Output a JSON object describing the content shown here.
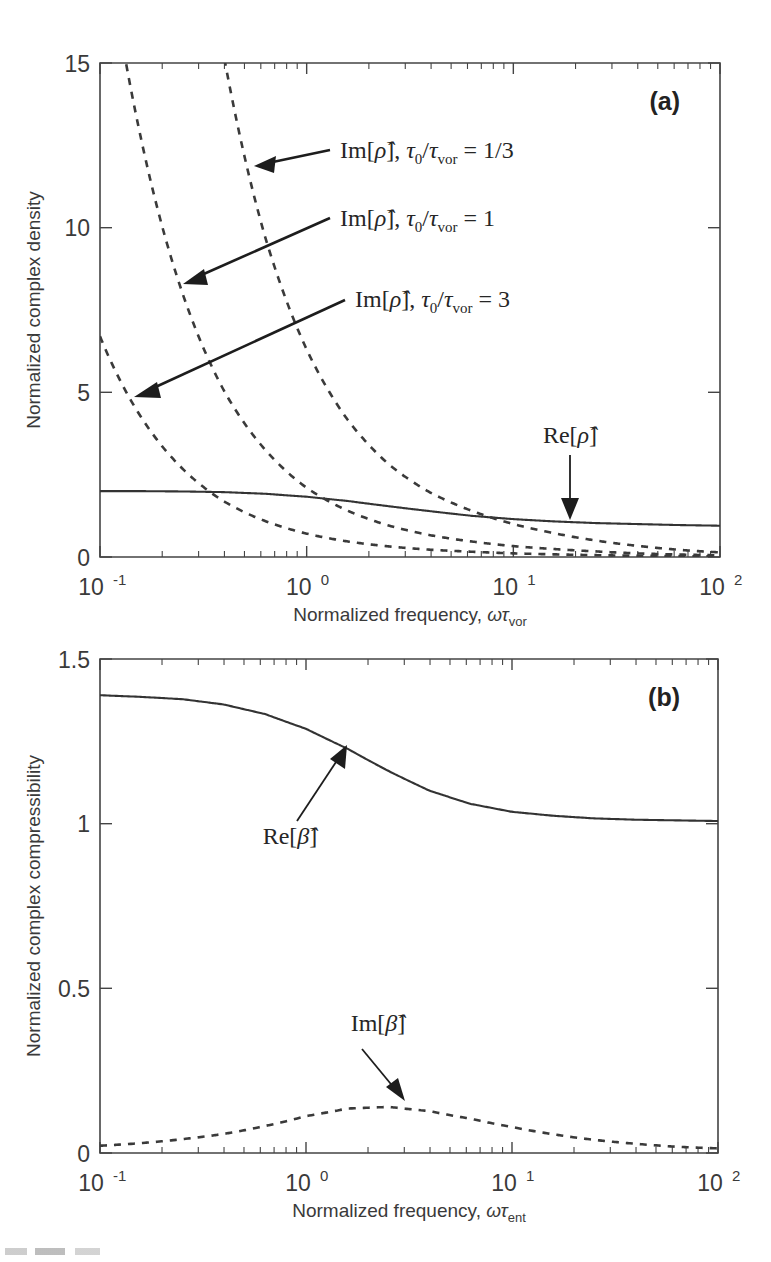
{
  "figure": {
    "panels": [
      {
        "tag": "(a)",
        "ylabel": "Normalized complex density",
        "xlabel_main": "Normalized frequency, ",
        "xlabel_sym": "ωτ",
        "xlabel_sub": "vor",
        "ytick_labels": [
          "0",
          "5",
          "10",
          "15"
        ],
        "xtick_labels": [
          "10",
          "10",
          "10",
          "10"
        ],
        "xtick_exps": [
          "-1",
          "0",
          "1",
          "2"
        ],
        "annotations": [
          {
            "name": "im-rho-third",
            "text_pre": "Im[",
            "sym": "ρ̂",
            "text_post": "], ",
            "tau": "τ",
            "tau_sub": "0",
            "slash": "/",
            "tau2": "τ",
            "tau2_sub": "vor",
            "eq": " = 1/3"
          },
          {
            "name": "im-rho-one",
            "text_pre": "Im[",
            "sym": "ρ̂",
            "text_post": "], ",
            "tau": "τ",
            "tau_sub": "0",
            "slash": "/",
            "tau2": "τ",
            "tau2_sub": "vor",
            "eq": " = 1"
          },
          {
            "name": "im-rho-three",
            "text_pre": "Im[",
            "sym": "ρ̂",
            "text_post": "], ",
            "tau": "τ",
            "tau_sub": "0",
            "slash": "/",
            "tau2": "τ",
            "tau2_sub": "vor",
            "eq": " = 3"
          },
          {
            "name": "re-rho",
            "text_pre": "Re[",
            "sym": "ρ̂",
            "text_post": "]",
            "tau": "",
            "tau_sub": "",
            "slash": "",
            "tau2": "",
            "tau2_sub": "",
            "eq": ""
          }
        ]
      },
      {
        "tag": "(b)",
        "ylabel": "Normalized complex compressibility",
        "xlabel_main": "Normalized frequency, ",
        "xlabel_sym": "ωτ",
        "xlabel_sub": "ent",
        "ytick_labels": [
          "0",
          "0.5",
          "1",
          "1.5"
        ],
        "xtick_labels": [
          "10",
          "10",
          "10",
          "10"
        ],
        "xtick_exps": [
          "-1",
          "0",
          "1",
          "2"
        ],
        "annotations": [
          {
            "name": "re-beta",
            "text_pre": "Re[",
            "sym": "β̂",
            "text_post": "]"
          },
          {
            "name": "im-beta",
            "text_pre": "Im[",
            "sym": "β̂",
            "text_post": "]"
          }
        ]
      }
    ]
  },
  "chart_data": [
    {
      "type": "line",
      "panel": "(a)",
      "title": "",
      "xlabel": "Normalized frequency, ωτ_vor",
      "ylabel": "Normalized complex density",
      "xscale": "log",
      "xlim": [
        0.1,
        100
      ],
      "ylim": [
        0,
        15
      ],
      "yticks": [
        0,
        5,
        10,
        15
      ],
      "xticks": [
        0.1,
        1,
        10,
        100
      ],
      "grid": false,
      "legend_position": "inline-annotations",
      "series": [
        {
          "name": "Re[ρ̂]",
          "style": "solid",
          "x": [
            0.1,
            0.158,
            0.251,
            0.398,
            0.631,
            1.0,
            1.585,
            2.512,
            3.981,
            6.31,
            10.0,
            15.85,
            25.12,
            39.81,
            63.1,
            100.0
          ],
          "y": [
            2.0,
            2.0,
            1.99,
            1.97,
            1.92,
            1.83,
            1.7,
            1.54,
            1.39,
            1.25,
            1.15,
            1.08,
            1.03,
            1.0,
            0.97,
            0.95
          ]
        },
        {
          "name": "Im[ρ̂], τ₀/τ_vor = 1/3",
          "style": "dashed",
          "x": [
            0.1,
            0.158,
            0.251,
            0.398,
            0.631,
            1.0,
            1.585,
            2.512,
            3.981,
            6.31,
            10.0,
            15.85,
            25.12,
            39.81,
            63.1,
            100.0
          ],
          "y": [
            60.0,
            38.0,
            24.0,
            15.2,
            9.7,
            6.3,
            4.15,
            2.8,
            1.95,
            1.4,
            1.0,
            0.72,
            0.5,
            0.34,
            0.22,
            0.14
          ]
        },
        {
          "name": "Im[ρ̂], τ₀/τ_vor = 1",
          "style": "dashed",
          "x": [
            0.1,
            0.158,
            0.251,
            0.398,
            0.631,
            1.0,
            1.585,
            2.512,
            3.981,
            6.31,
            10.0,
            15.85,
            25.12,
            39.81,
            63.1,
            100.0
          ],
          "y": [
            20.0,
            12.7,
            8.0,
            5.05,
            3.25,
            2.1,
            1.4,
            0.95,
            0.66,
            0.47,
            0.33,
            0.24,
            0.17,
            0.11,
            0.075,
            0.05
          ]
        },
        {
          "name": "Im[ρ̂], τ₀/τ_vor = 3",
          "style": "dashed",
          "x": [
            0.1,
            0.158,
            0.251,
            0.398,
            0.631,
            1.0,
            1.585,
            2.512,
            3.981,
            6.31,
            10.0,
            15.85,
            25.12,
            39.81,
            63.1,
            100.0
          ],
          "y": [
            6.7,
            4.25,
            2.68,
            1.69,
            1.09,
            0.71,
            0.47,
            0.32,
            0.22,
            0.16,
            0.11,
            0.08,
            0.056,
            0.038,
            0.025,
            0.017
          ]
        }
      ]
    },
    {
      "type": "line",
      "panel": "(b)",
      "title": "",
      "xlabel": "Normalized frequency, ωτ_ent",
      "ylabel": "Normalized complex compressibility",
      "xscale": "log",
      "xlim": [
        0.1,
        100
      ],
      "ylim": [
        0,
        1.5
      ],
      "yticks": [
        0,
        0.5,
        1,
        1.5
      ],
      "xticks": [
        0.1,
        1,
        10,
        100
      ],
      "grid": false,
      "legend_position": "inline-annotations",
      "series": [
        {
          "name": "Re[β̂]",
          "style": "solid",
          "x": [
            0.1,
            0.158,
            0.251,
            0.398,
            0.631,
            1.0,
            1.585,
            2.512,
            3.981,
            6.31,
            10.0,
            15.85,
            25.12,
            39.81,
            63.1,
            100.0
          ],
          "y": [
            1.39,
            1.385,
            1.378,
            1.362,
            1.333,
            1.288,
            1.228,
            1.16,
            1.1,
            1.06,
            1.036,
            1.024,
            1.016,
            1.012,
            1.01,
            1.008
          ]
        },
        {
          "name": "Im[β̂]",
          "style": "dashed",
          "x": [
            0.1,
            0.158,
            0.251,
            0.398,
            0.631,
            1.0,
            1.585,
            2.512,
            3.981,
            6.31,
            10.0,
            15.85,
            25.12,
            39.81,
            63.1,
            100.0
          ],
          "y": [
            0.022,
            0.03,
            0.042,
            0.058,
            0.082,
            0.112,
            0.135,
            0.14,
            0.127,
            0.104,
            0.079,
            0.057,
            0.04,
            0.028,
            0.019,
            0.014
          ]
        }
      ]
    }
  ]
}
